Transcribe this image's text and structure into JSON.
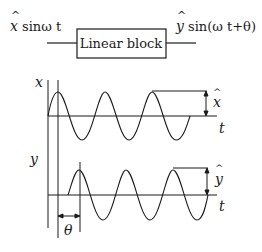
{
  "block": {
    "label": "Linear block",
    "input_label": "x̂ sinω t",
    "output_label": "ŷ sin(ω t+θ)",
    "input_hat": "^",
    "input_var": "x",
    "input_rest": "sinω t",
    "output_hat": "^",
    "output_var": "y",
    "output_rest": "sin(ω t+θ)"
  },
  "plots": {
    "top": {
      "axis_label": "x",
      "time_label": "t",
      "amplitude_label": "x",
      "amplitude_hat": "^"
    },
    "bottom": {
      "axis_label": "y",
      "time_label": "t",
      "amplitude_label": "y",
      "amplitude_hat": "^"
    },
    "phase_label": "θ"
  },
  "colors": {
    "ink": "#1a1a1a",
    "background": "#ffffff"
  }
}
